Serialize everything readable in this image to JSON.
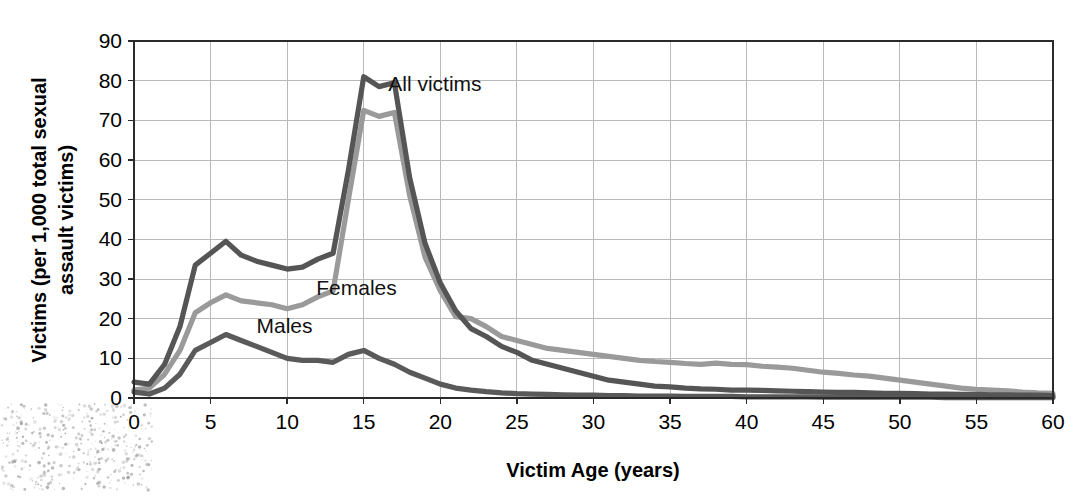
{
  "chart_data": {
    "type": "line",
    "title": "",
    "xlabel": "Victim Age (years)",
    "ylabel": "Victims (per 1,000 total sexual assault victims)",
    "xlim": [
      0,
      60
    ],
    "ylim": [
      0,
      90
    ],
    "xticks": [
      "0",
      "5",
      "10",
      "15",
      "20",
      "25",
      "30",
      "35",
      "40",
      "45",
      "50",
      "55",
      "60"
    ],
    "yticks": [
      "0",
      "10",
      "20",
      "30",
      "40",
      "50",
      "60",
      "70",
      "80",
      "90"
    ],
    "grid": true,
    "legend_position": "inline-annotations",
    "x": [
      0,
      1,
      2,
      3,
      4,
      5,
      6,
      7,
      8,
      9,
      10,
      11,
      12,
      13,
      14,
      15,
      16,
      17,
      18,
      19,
      20,
      21,
      22,
      23,
      24,
      25,
      26,
      27,
      28,
      29,
      30,
      31,
      32,
      33,
      34,
      35,
      36,
      37,
      38,
      39,
      40,
      41,
      42,
      43,
      44,
      45,
      46,
      47,
      48,
      49,
      50,
      51,
      52,
      53,
      54,
      55,
      56,
      57,
      58,
      59,
      60
    ],
    "series": [
      {
        "name": "All victims",
        "color": "#555555",
        "label_x": 16.6,
        "label_y": 77.5,
        "values": [
          4.0,
          3.5,
          8.5,
          18.0,
          33.5,
          36.5,
          39.5,
          36.0,
          34.5,
          33.5,
          32.5,
          33.0,
          35.0,
          36.5,
          57.5,
          81.0,
          78.5,
          79.5,
          55.5,
          39.0,
          29.0,
          22.0,
          17.5,
          15.5,
          13.0,
          11.5,
          9.5,
          8.5,
          7.5,
          6.5,
          5.5,
          4.5,
          4.0,
          3.5,
          3.0,
          2.8,
          2.5,
          2.3,
          2.2,
          2.0,
          2.0,
          1.9,
          1.8,
          1.7,
          1.6,
          1.5,
          1.4,
          1.4,
          1.3,
          1.2,
          1.2,
          1.1,
          1.0,
          1.0,
          0.9,
          0.9,
          0.8,
          0.8,
          0.7,
          0.7,
          0.6
        ]
      },
      {
        "name": "Females",
        "color": "#9a9a9a",
        "label_x": 11.9,
        "label_y": 26.0,
        "values": [
          2.0,
          2.5,
          6.0,
          12.0,
          21.5,
          24.0,
          26.0,
          24.5,
          24.0,
          23.5,
          22.5,
          23.5,
          25.5,
          27.0,
          50.0,
          72.5,
          71.0,
          72.0,
          51.0,
          35.5,
          27.0,
          20.5,
          20.0,
          18.0,
          15.5,
          14.5,
          13.5,
          12.5,
          12.0,
          11.5,
          11.0,
          10.5,
          10.0,
          9.5,
          9.2,
          9.0,
          8.7,
          8.5,
          8.8,
          8.5,
          8.4,
          8.0,
          7.8,
          7.5,
          7.0,
          6.5,
          6.2,
          5.8,
          5.5,
          5.0,
          4.5,
          4.0,
          3.5,
          3.0,
          2.5,
          2.2,
          2.0,
          1.8,
          1.5,
          1.3,
          1.2
        ]
      },
      {
        "name": "Males",
        "color": "#5a5a5a",
        "label_x": 8.0,
        "label_y": 16.5,
        "values": [
          1.5,
          1.0,
          2.5,
          6.0,
          12.0,
          14.0,
          16.0,
          14.5,
          13.0,
          11.5,
          10.0,
          9.5,
          9.5,
          9.0,
          11.0,
          12.0,
          10.0,
          8.5,
          6.5,
          5.0,
          3.5,
          2.5,
          2.0,
          1.6,
          1.3,
          1.1,
          1.0,
          0.9,
          0.8,
          0.7,
          0.7,
          0.6,
          0.6,
          0.5,
          0.5,
          0.5,
          0.4,
          0.4,
          0.4,
          0.4,
          0.3,
          0.3,
          0.3,
          0.3,
          0.3,
          0.2,
          0.2,
          0.2,
          0.2,
          0.2,
          0.2,
          0.2,
          0.2,
          0.1,
          0.1,
          0.1,
          0.1,
          0.1,
          0.1,
          0.1,
          0.1
        ]
      }
    ]
  }
}
